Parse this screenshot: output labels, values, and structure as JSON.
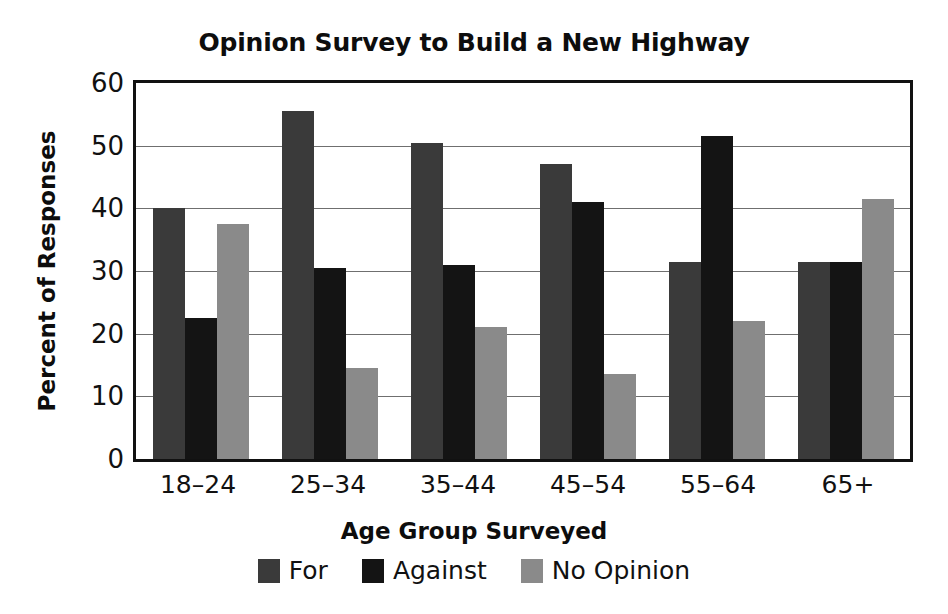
{
  "chart_data": {
    "type": "bar",
    "title": "Opinion Survey to Build a New Highway",
    "xlabel": "Age Group Surveyed",
    "ylabel": "Percent of Responses",
    "categories": [
      "18–24",
      "25–34",
      "35–44",
      "45–54",
      "55–64",
      "65+"
    ],
    "series": [
      {
        "name": "For",
        "color": "#3a3a3a",
        "values": [
          40.0,
          55.5,
          50.5,
          47.0,
          31.5,
          31.5
        ]
      },
      {
        "name": "Against",
        "color": "#141414",
        "values": [
          22.5,
          30.5,
          31.0,
          41.0,
          51.5,
          31.5
        ]
      },
      {
        "name": "No Opinion",
        "color": "#8a8a8a",
        "values": [
          37.5,
          14.5,
          21.0,
          13.5,
          22.0,
          41.5
        ]
      }
    ],
    "ylim": [
      0,
      60
    ],
    "yticks": [
      0,
      10,
      20,
      30,
      40,
      50,
      60
    ],
    "ytick_labels": [
      "0",
      "10",
      "20",
      "30",
      "40",
      "50",
      "60"
    ],
    "grid": true,
    "legend_position": "bottom"
  }
}
